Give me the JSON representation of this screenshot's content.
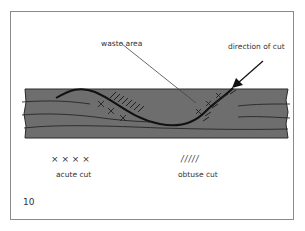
{
  "figure": {
    "number": "10",
    "labels": {
      "waste_area": "waste area",
      "direction_of_cut": "direction of cut"
    },
    "legend": [
      {
        "symbol": "× × × ×",
        "label": "acute cut"
      },
      {
        "symbol": "/////",
        "label": "obtuse cut"
      }
    ],
    "colors": {
      "board": "#6e6e6e",
      "grain": "#2a2a2a",
      "cut_line": "#111111",
      "frame": "#8a8a8a",
      "text": "#333333"
    }
  }
}
